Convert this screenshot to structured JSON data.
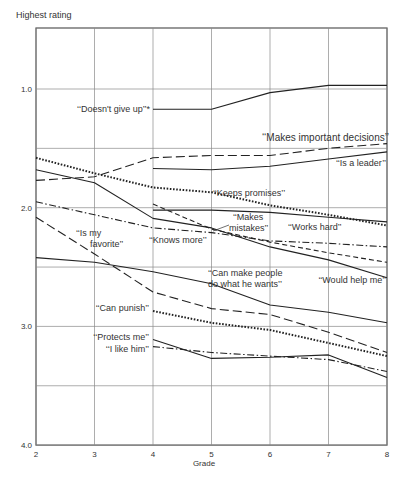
{
  "chart_data": {
    "type": "line",
    "title": "",
    "xlabel": "Grade",
    "ylabel": "Highest rating",
    "x": [
      2,
      3,
      4,
      5,
      6,
      7,
      8
    ],
    "xticks": [
      "2",
      "3",
      "4",
      "5",
      "6",
      "7",
      "8"
    ],
    "ylim": [
      4.0,
      0.8
    ],
    "yticks": [
      "1.0",
      "2.0",
      "3.0",
      "4.0"
    ],
    "ytick_values": [
      1.0,
      2.0,
      3.0,
      4.0
    ],
    "grid_y": [
      1.0,
      1.5,
      2.0,
      2.5,
      3.0,
      3.5,
      4.0
    ],
    "grid": true,
    "legend": "inline labels",
    "series": [
      {
        "name": "“Doesn't give up”*",
        "style": "solid",
        "x": [
          4,
          5,
          6,
          7,
          8
        ],
        "values": [
          1.17,
          1.17,
          1.03,
          0.97,
          0.97
        ],
        "label": {
          "text": "‘‘Doesn't give up’’*",
          "x": 150,
          "y": 112,
          "anchor": "end"
        }
      },
      {
        "name": "“Makes important decisions”",
        "style": "dashed",
        "x": [
          2,
          3,
          4,
          5,
          6,
          7,
          8
        ],
        "values": [
          1.77,
          1.74,
          1.58,
          1.56,
          1.56,
          1.5,
          1.46
        ],
        "label": {
          "text": "‘‘Makes important decisions’’",
          "x": 389,
          "y": 141,
          "anchor": "end",
          "size": 10
        }
      },
      {
        "name": "“Is a leader”",
        "style": "solid",
        "x": [
          4,
          5,
          6,
          7,
          8
        ],
        "values": [
          1.67,
          1.68,
          1.65,
          1.59,
          1.53
        ],
        "label": {
          "text": "‘‘Is a leader’’",
          "x": 386,
          "y": 166,
          "anchor": "end"
        }
      },
      {
        "name": "“Keeps promises”",
        "style": "dotted",
        "x": [
          2,
          3,
          4,
          5,
          6,
          7,
          8
        ],
        "values": [
          1.58,
          1.71,
          1.83,
          1.87,
          1.98,
          2.06,
          2.15
        ],
        "label": {
          "text": "‘‘Keeps promises’’",
          "x": 213,
          "y": 196,
          "anchor": "start"
        }
      },
      {
        "name": "“Works hard”",
        "style": "solid",
        "x": [
          4,
          5,
          6,
          7,
          8
        ],
        "values": [
          2.02,
          2.02,
          2.04,
          2.08,
          2.12
        ],
        "label": {
          "text": "‘‘Works hard’’",
          "x": 288,
          "y": 230,
          "anchor": "start"
        }
      },
      {
        "name": "“Knows more”",
        "style": "solid",
        "x": [
          2,
          3,
          4,
          5,
          6,
          7,
          8
        ],
        "values": [
          1.68,
          1.79,
          2.09,
          2.17,
          2.33,
          2.44,
          2.59
        ],
        "label": {
          "text": "‘‘Knows more’’",
          "x": 149,
          "y": 243,
          "anchor": "start"
        }
      },
      {
        "name": "“Makes mistakes”",
        "style": "shortdash",
        "x": [
          4,
          5,
          6,
          7,
          8
        ],
        "values": [
          1.97,
          2.18,
          2.29,
          2.38,
          2.46
        ],
        "label": {
          "text": "‘‘Makes",
          "text2": "mistakes’’",
          "x": 233,
          "y": 220,
          "anchor": "start"
        }
      },
      {
        "name": "“Would help me”",
        "style": "dashdot",
        "x": [
          2,
          3,
          4,
          5,
          6,
          7,
          8
        ],
        "values": [
          1.95,
          2.06,
          2.17,
          2.21,
          2.28,
          2.3,
          2.33
        ],
        "label": {
          "text": "‘‘Would help me’’",
          "x": 386,
          "y": 283,
          "anchor": "end"
        }
      },
      {
        "name": "“Is my favorite”",
        "style": "dashed",
        "x": [
          2,
          3,
          4,
          5,
          6,
          7,
          8
        ],
        "values": [
          2.08,
          2.39,
          2.71,
          2.85,
          2.9,
          3.05,
          3.22
        ],
        "label": {
          "text": "‘‘Is my",
          "text2": "favorite’’",
          "x": 76,
          "y": 236,
          "anchor": "start"
        }
      },
      {
        "name": "“Can make people do what he wants”",
        "style": "solid",
        "x": [
          2,
          3,
          4,
          5,
          6,
          7,
          8
        ],
        "values": [
          2.42,
          2.46,
          2.54,
          2.64,
          2.82,
          2.88,
          2.97
        ],
        "label": {
          "text": "‘‘Can make people",
          "text2": "do what he wants’’",
          "x": 208,
          "y": 276,
          "anchor": "start"
        }
      },
      {
        "name": "“Can punish”",
        "style": "dotted",
        "x": [
          4,
          5,
          6,
          7,
          8
        ],
        "values": [
          2.87,
          2.97,
          3.03,
          3.14,
          3.25
        ],
        "label": {
          "text": "‘‘Can punish’’",
          "x": 149,
          "y": 311,
          "anchor": "end"
        }
      },
      {
        "name": "“Protects me”",
        "style": "solid",
        "x": [
          4,
          5,
          6,
          7,
          8
        ],
        "values": [
          3.11,
          3.27,
          3.26,
          3.24,
          3.43
        ],
        "label": {
          "text": "‘‘Protects me’’",
          "x": 149,
          "y": 340,
          "anchor": "end"
        }
      },
      {
        "name": "“I like him”",
        "style": "dashdot",
        "x": [
          4,
          5,
          6,
          7,
          8
        ],
        "values": [
          3.17,
          3.22,
          3.25,
          3.28,
          3.38
        ],
        "label": {
          "text": "‘‘I like him’’",
          "x": 149,
          "y": 352,
          "anchor": "end"
        }
      }
    ]
  },
  "labels": {
    "y_axis_title": "Highest rating",
    "x_axis_title": "Grade"
  }
}
